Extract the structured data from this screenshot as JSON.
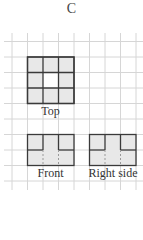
{
  "title": "C",
  "labels": {
    "top": "Top",
    "front": "Front",
    "right": "Right side"
  },
  "colors": {
    "grid": "#d4d4d4",
    "fill": "#e8e8e8",
    "stroke": "#3a3a3a",
    "text": "#333333"
  },
  "views": [
    {
      "name": "top",
      "cols": 3,
      "rows": 3,
      "shaded": [
        [
          1,
          1,
          1
        ],
        [
          1,
          0,
          1
        ],
        [
          1,
          1,
          1
        ]
      ]
    },
    {
      "name": "front",
      "cols": 3,
      "rows": 2
    },
    {
      "name": "right",
      "cols": 3,
      "rows": 2
    }
  ]
}
